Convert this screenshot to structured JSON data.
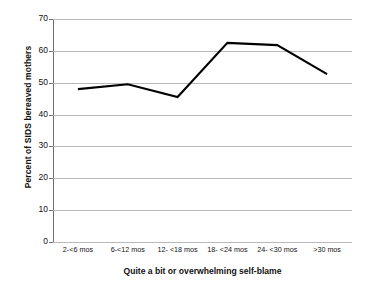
{
  "chart_data": {
    "type": "line",
    "title": "",
    "subtitle": "",
    "xlabel": "Quite a bit or overwhelming self-blame",
    "ylabel": "Percent of SIDS bereaved mothers",
    "categories": [
      "2-<6 mos",
      "6-<12 mos",
      "12- <18 mos",
      "18- <24 mos",
      "24- <30 mos",
      ">30 mos"
    ],
    "values": [
      48.0,
      49.5,
      45.5,
      62.5,
      61.8,
      52.7
    ],
    "series": [
      {
        "name": "Percent of SIDS bereaved mothers",
        "values": [
          48.0,
          49.5,
          45.5,
          62.5,
          61.8,
          52.7
        ]
      }
    ],
    "ylim": [
      0,
      70
    ],
    "y_ticks": [
      0,
      10,
      20,
      30,
      40,
      50,
      60,
      70
    ],
    "y_tick_labels": [
      "0",
      "10",
      "20",
      "30",
      "40",
      "50",
      "60",
      "70"
    ],
    "grid": true,
    "grid_axis": "y",
    "legend": false,
    "legend_position": "none",
    "line_color": "#000000",
    "grid_color": "#b9b9b9",
    "axis_color": "#6f6f6f",
    "background_color": "#ffffff"
  }
}
